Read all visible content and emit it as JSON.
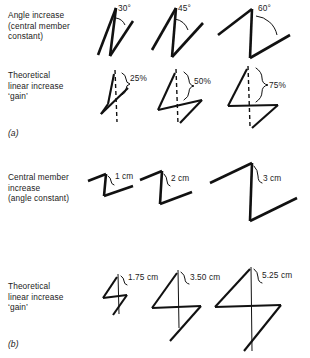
{
  "diagram": {
    "rows": [
      {
        "id": "angle-increase",
        "label": "Angle increase\n(central member\nconstant)",
        "caption": null,
        "figures": [
          {
            "id": "angle-30",
            "label": "30°"
          },
          {
            "id": "angle-45",
            "label": "45°"
          },
          {
            "id": "angle-60",
            "label": "60°"
          }
        ]
      },
      {
        "id": "theoretical-gain-percent",
        "label": "Theoretical\nlinear increase\n‘gain’",
        "caption": "(a)",
        "figures": [
          {
            "id": "gain-25",
            "label": "25%"
          },
          {
            "id": "gain-50",
            "label": "50%"
          },
          {
            "id": "gain-75",
            "label": "75%"
          }
        ]
      },
      {
        "id": "central-member-increase",
        "label": "Central member\nincrease\n(angle constant)",
        "caption": null,
        "figures": [
          {
            "id": "member-1cm",
            "label": "1 cm"
          },
          {
            "id": "member-2cm",
            "label": "2 cm"
          },
          {
            "id": "member-3cm",
            "label": "3 cm"
          }
        ]
      },
      {
        "id": "theoretical-gain-cm",
        "label": "Theoretical\nlinear increase\n‘gain’",
        "caption": "(b)",
        "figures": [
          {
            "id": "gain-175cm",
            "label": "1.75 cm"
          },
          {
            "id": "gain-350cm",
            "label": "3.50 cm"
          },
          {
            "id": "gain-525cm",
            "label": "5.25 cm"
          }
        ]
      }
    ],
    "colors": {
      "ink": "#111111",
      "text": "#1b1b1b",
      "background": "#ffffff"
    }
  }
}
